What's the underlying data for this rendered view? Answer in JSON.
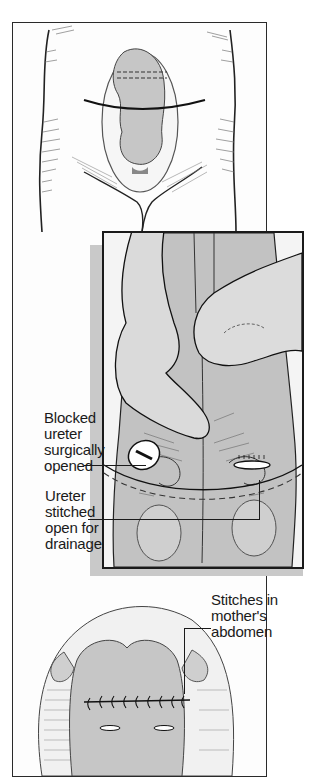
{
  "figure": {
    "panels": [
      {
        "id": "top",
        "description": "Mother's abdomen showing fetus in uterus with incision line"
      },
      {
        "id": "middle",
        "description": "Fetal back held by surgeon's fingers showing opened ureters"
      },
      {
        "id": "bottom",
        "description": "Closed uterus with stitches in mother's abdomen"
      }
    ],
    "labels": {
      "blocked": [
        "Blocked",
        "ureter",
        "surgically",
        "opened"
      ],
      "stitched": [
        "Ureter",
        "stitched",
        "open for",
        "drainage"
      ],
      "mother": [
        "Stitches in",
        "mother's",
        "abdomen"
      ]
    },
    "colors": {
      "line": "#1a1a1a",
      "skin_light": "#f2f2f2",
      "tissue_gray": "#c8c8c8",
      "shadow": "#c9c9c9"
    }
  }
}
